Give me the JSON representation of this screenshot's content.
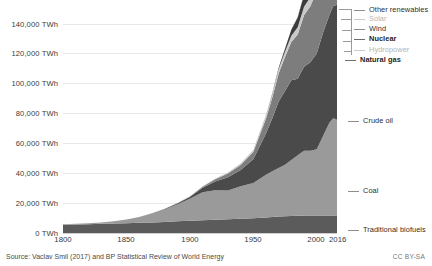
{
  "chart_data": {
    "type": "area",
    "stacked": true,
    "title": "",
    "subtitle": "",
    "xlabel": "",
    "ylabel": "",
    "xlim": [
      1800,
      2016
    ],
    "ylim": [
      0,
      150000
    ],
    "y_tick_values": [
      0,
      20000,
      40000,
      60000,
      80000,
      100000,
      120000,
      140000
    ],
    "y_tick_labels": [
      "0 TWh",
      "20,000 TWh",
      "40,000 TWh",
      "60,000 TWh",
      "80,000 TWh",
      "100,000 TWh",
      "120,000 TWh",
      "140,000 TWh"
    ],
    "y_unit": "TWh",
    "x_tick_values": [
      1800,
      1850,
      1900,
      1950,
      2000,
      2016
    ],
    "x_tick_labels": [
      "1800",
      "1850",
      "1900",
      "1950",
      "2000",
      "2016"
    ],
    "grid": "horizontal",
    "legend_position": "right-inline-labels",
    "x": [
      1800,
      1810,
      1820,
      1830,
      1840,
      1850,
      1860,
      1870,
      1880,
      1890,
      1900,
      1910,
      1920,
      1930,
      1940,
      1950,
      1960,
      1965,
      1970,
      1975,
      1980,
      1985,
      1990,
      1995,
      2000,
      2005,
      2010,
      2013,
      2016
    ],
    "series": [
      {
        "name": "Traditional biofuels",
        "color": "#5b5b5b",
        "values": [
          5600,
          5800,
          6000,
          6200,
          6400,
          6600,
          6900,
          7200,
          7500,
          7900,
          8300,
          8700,
          9000,
          9300,
          9700,
          10000,
          10600,
          10900,
          11200,
          11400,
          11600,
          11700,
          11800,
          11900,
          11900,
          11900,
          11900,
          11900,
          11900
        ]
      },
      {
        "name": "Coal",
        "color": "#9a9a9a",
        "values": [
          260,
          400,
          600,
          900,
          1500,
          2500,
          4000,
          6000,
          8500,
          11500,
          15000,
          19000,
          20000,
          19500,
          22000,
          24000,
          29000,
          31000,
          33000,
          35000,
          38000,
          41000,
          44000,
          44000,
          45000,
          54000,
          63000,
          66000,
          65000
        ]
      },
      {
        "name": "Crude oil",
        "color": "#4a4a4a",
        "values": [
          0,
          0,
          0,
          0,
          0,
          0,
          30,
          120,
          300,
          600,
          1200,
          3000,
          6000,
          9000,
          11000,
          16000,
          28000,
          36000,
          45000,
          50000,
          54000,
          52000,
          57000,
          60000,
          65000,
          70000,
          73000,
          76000,
          78000
        ]
      },
      {
        "name": "Natural gas",
        "color": "#7d7d7d",
        "values": [
          0,
          0,
          0,
          0,
          0,
          0,
          0,
          20,
          60,
          150,
          300,
          700,
          1500,
          2500,
          3500,
          5000,
          10000,
          14000,
          19000,
          23000,
          26000,
          30000,
          35000,
          38000,
          42000,
          47000,
          53000,
          56000,
          58000
        ]
      },
      {
        "name": "Hydropower",
        "color": "#c9c9c9",
        "values": [
          0,
          0,
          0,
          0,
          0,
          0,
          0,
          0,
          10,
          40,
          100,
          250,
          450,
          700,
          900,
          1300,
          2000,
          2500,
          3100,
          3700,
          4300,
          5000,
          5700,
          6200,
          6800,
          7500,
          8600,
          9200,
          9800
        ]
      },
      {
        "name": "Nuclear",
        "color": "#3c3c3c",
        "values": [
          0,
          0,
          0,
          0,
          0,
          0,
          0,
          0,
          0,
          0,
          0,
          0,
          0,
          0,
          0,
          0,
          200,
          400,
          900,
          2000,
          4000,
          6500,
          8000,
          8800,
          9300,
          9500,
          9100,
          8600,
          8800
        ]
      },
      {
        "name": "Wind",
        "color": "#8a8a8a",
        "values": [
          0,
          0,
          0,
          0,
          0,
          0,
          0,
          0,
          0,
          0,
          0,
          0,
          0,
          0,
          0,
          0,
          0,
          0,
          0,
          0,
          0,
          10,
          40,
          100,
          300,
          800,
          2000,
          3000,
          4000
        ]
      },
      {
        "name": "Solar",
        "color": "#d4d4d4",
        "values": [
          0,
          0,
          0,
          0,
          0,
          0,
          0,
          0,
          0,
          0,
          0,
          0,
          0,
          0,
          0,
          0,
          0,
          0,
          0,
          0,
          0,
          0,
          0,
          5,
          10,
          40,
          200,
          600,
          1100
        ]
      },
      {
        "name": "Other renewables",
        "color": "#6a6a6a",
        "values": [
          0,
          0,
          0,
          0,
          0,
          0,
          0,
          0,
          0,
          0,
          0,
          0,
          0,
          0,
          0,
          0,
          0,
          20,
          60,
          120,
          250,
          450,
          700,
          900,
          1200,
          1600,
          2100,
          2400,
          2700
        ]
      }
    ]
  },
  "axis": {
    "y_ticks": [
      {
        "label": "140,000 TWh",
        "value": 140000
      },
      {
        "label": "120,000 TWh",
        "value": 120000
      },
      {
        "label": "100,000 TWh",
        "value": 100000
      },
      {
        "label": "80,000 TWh",
        "value": 80000
      },
      {
        "label": "60,000 TWh",
        "value": 60000
      },
      {
        "label": "40,000 TWh",
        "value": 40000
      },
      {
        "label": "20,000 TWh",
        "value": 20000
      },
      {
        "label": "0 TWh",
        "value": 0
      }
    ],
    "x_ticks": [
      {
        "label": "1800",
        "value": 1800
      },
      {
        "label": "1850",
        "value": 1850
      },
      {
        "label": "1900",
        "value": 1900
      },
      {
        "label": "1950",
        "value": 1950
      },
      {
        "label": "2000",
        "value": 2000
      },
      {
        "label": "2016",
        "value": 2016
      }
    ]
  },
  "legend": {
    "items": [
      {
        "label": "Other renewables",
        "style": "normal",
        "color": "#6a6a6a"
      },
      {
        "label": "Solar",
        "style": "muted",
        "color": "#d4d4d4"
      },
      {
        "label": "Wind",
        "style": "normal",
        "color": "#8a8a8a"
      },
      {
        "label": "Nuclear",
        "style": "bold",
        "color": "#3c3c3c"
      },
      {
        "label": "Hydropower",
        "style": "muted",
        "color": "#c9c9c9"
      },
      {
        "label": "Natural gas",
        "style": "bold",
        "color": "#7d7d7d"
      },
      {
        "label": "Crude oil",
        "style": "normal",
        "color": "#4a4a4a"
      },
      {
        "label": "Coal",
        "style": "normal",
        "color": "#9a9a9a"
      },
      {
        "label": "Traditional biofuels",
        "style": "normal",
        "color": "#5b5b5b"
      }
    ]
  },
  "footer": {
    "source": "Source: Vaclav Smil (2017) and BP Statistical Review of World Energy",
    "license": "CC BY-SA"
  }
}
